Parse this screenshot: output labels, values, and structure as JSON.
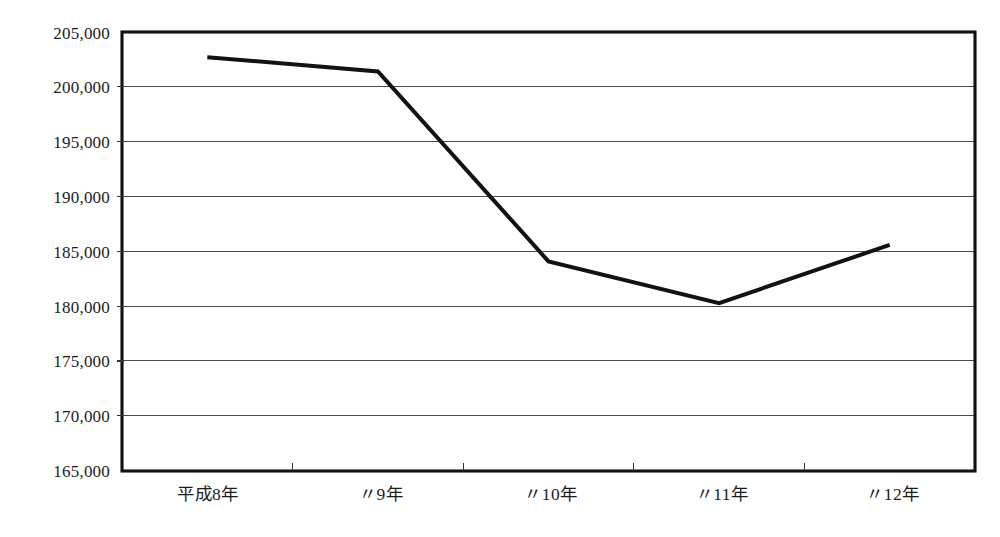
{
  "chart_data": {
    "type": "line",
    "title": "",
    "subtitle": "",
    "xlabel": "",
    "ylabel": "",
    "categories": [
      "平成8年",
      "〃9年",
      "〃10年",
      "〃11年",
      "〃12年"
    ],
    "values": [
      202700,
      201400,
      184100,
      180300,
      185600
    ],
    "series": [
      {
        "name": "",
        "values": [
          202700,
          201400,
          184100,
          180300,
          185600
        ]
      }
    ],
    "ylim": [
      165000,
      205000
    ],
    "ytick_values": [
      165000,
      170000,
      175000,
      180000,
      185000,
      190000,
      195000,
      200000,
      205000
    ],
    "ytick_labels": [
      "165,000",
      "170,000",
      "175,000",
      "180,000",
      "185,000",
      "190,000",
      "195,000",
      "200,000",
      "205,000"
    ],
    "xtick_labels": [
      "平成8年",
      "〃9年",
      "〃10年",
      "〃11年",
      "〃12年"
    ],
    "grid": "horizontal",
    "legend": "none",
    "line_color": "#121212",
    "grid_color": "#4a4a4a",
    "frame_color": "#111111",
    "background_color": "#ffffff",
    "markers": "none",
    "annotations": []
  },
  "axis": {
    "y_labels": [
      {
        "value": "205,000"
      },
      {
        "value": "200,000"
      },
      {
        "value": "195,000"
      },
      {
        "value": "190,000"
      },
      {
        "value": "185,000"
      },
      {
        "value": "180,000"
      },
      {
        "value": "175,000"
      },
      {
        "value": "170,000"
      },
      {
        "value": "165,000"
      }
    ],
    "x_labels": [
      {
        "value": "平成8年"
      },
      {
        "value": "〃9年"
      },
      {
        "value": "〃10年"
      },
      {
        "value": "〃11年"
      },
      {
        "value": "〃12年"
      }
    ]
  }
}
